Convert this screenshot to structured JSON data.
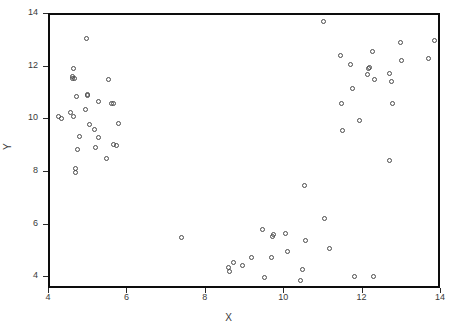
{
  "chart_data": {
    "type": "scatter",
    "title": "",
    "xlabel": "X",
    "ylabel": "Y",
    "xlim": [
      4,
      14
    ],
    "ylim": [
      3.55,
      14
    ],
    "xticks": [
      4,
      6,
      8,
      10,
      12,
      14
    ],
    "yticks": [
      4,
      6,
      8,
      10,
      12,
      14
    ],
    "xtick_labels": [
      "4",
      "6",
      "8",
      "10",
      "12",
      "14"
    ],
    "ytick_labels": [
      "4",
      "6",
      "8",
      "10",
      "12",
      "14"
    ],
    "grid": false,
    "legend": null,
    "marker": "open-circle",
    "marker_color": "#4a4a4a",
    "series": [
      {
        "name": "points",
        "points": [
          [
            4.28,
            10.05
          ],
          [
            4.34,
            10.0
          ],
          [
            4.58,
            10.22
          ],
          [
            4.62,
            11.6
          ],
          [
            4.63,
            11.52
          ],
          [
            4.64,
            11.88
          ],
          [
            4.66,
            10.05
          ],
          [
            4.68,
            11.5
          ],
          [
            4.7,
            8.1
          ],
          [
            4.71,
            7.93
          ],
          [
            4.73,
            10.83
          ],
          [
            4.75,
            8.83
          ],
          [
            4.8,
            9.32
          ],
          [
            4.95,
            10.35
          ],
          [
            4.97,
            13.02
          ],
          [
            5.0,
            10.92
          ],
          [
            5.02,
            10.88
          ],
          [
            5.05,
            9.78
          ],
          [
            5.18,
            9.58
          ],
          [
            5.22,
            8.9
          ],
          [
            5.28,
            10.62
          ],
          [
            5.3,
            9.28
          ],
          [
            5.48,
            8.48
          ],
          [
            5.55,
            11.47
          ],
          [
            5.62,
            10.57
          ],
          [
            5.66,
            10.55
          ],
          [
            5.68,
            9.0
          ],
          [
            5.74,
            8.98
          ],
          [
            5.8,
            9.82
          ],
          [
            7.4,
            5.48
          ],
          [
            8.6,
            4.32
          ],
          [
            8.63,
            4.18
          ],
          [
            8.72,
            4.52
          ],
          [
            8.97,
            4.4
          ],
          [
            9.18,
            4.72
          ],
          [
            9.48,
            5.78
          ],
          [
            9.52,
            3.95
          ],
          [
            9.7,
            4.72
          ],
          [
            9.73,
            5.52
          ],
          [
            9.75,
            5.58
          ],
          [
            10.05,
            5.62
          ],
          [
            10.12,
            4.95
          ],
          [
            10.45,
            3.82
          ],
          [
            10.5,
            4.25
          ],
          [
            10.58,
            5.35
          ],
          [
            10.55,
            7.45
          ],
          [
            11.02,
            13.67
          ],
          [
            11.05,
            6.2
          ],
          [
            11.18,
            5.07
          ],
          [
            11.82,
            4.0
          ],
          [
            11.45,
            12.38
          ],
          [
            11.48,
            10.55
          ],
          [
            11.52,
            9.52
          ],
          [
            11.72,
            12.05
          ],
          [
            11.78,
            11.12
          ],
          [
            11.95,
            9.93
          ],
          [
            12.18,
            11.88
          ],
          [
            12.2,
            11.92
          ],
          [
            12.15,
            11.68
          ],
          [
            12.28,
            12.55
          ],
          [
            12.32,
            11.47
          ],
          [
            12.3,
            4.0
          ],
          [
            12.72,
            11.7
          ],
          [
            12.75,
            11.4
          ],
          [
            12.78,
            10.57
          ],
          [
            12.7,
            8.4
          ],
          [
            12.98,
            12.88
          ],
          [
            13.02,
            12.2
          ],
          [
            13.7,
            12.28
          ],
          [
            13.85,
            12.95
          ]
        ]
      }
    ]
  }
}
